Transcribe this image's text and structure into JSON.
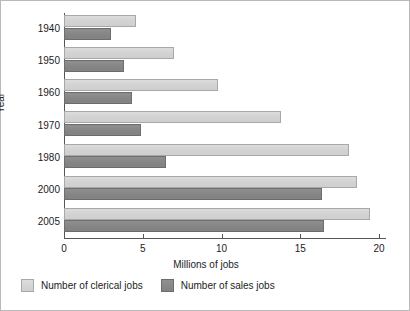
{
  "chart_data": {
    "type": "bar",
    "orientation": "horizontal",
    "title": "",
    "xlabel": "Millions of jobs",
    "ylabel": "Year",
    "categories": [
      "1940",
      "1950",
      "1960",
      "1970",
      "1980",
      "2000",
      "2005"
    ],
    "xlim": [
      0,
      20
    ],
    "xticks": [
      0,
      5,
      10,
      15,
      20
    ],
    "xtick_labels": [
      "0",
      "5",
      "10",
      "15",
      "20"
    ],
    "grid": false,
    "legend_position": "below-plot",
    "series": [
      {
        "name": "Number of clerical jobs",
        "color": "#d2d2d2",
        "values": [
          4.6,
          7.0,
          9.8,
          13.8,
          18.1,
          18.6,
          19.4
        ]
      },
      {
        "name": "Number of sales jobs",
        "color": "#858585",
        "values": [
          3.0,
          3.8,
          4.3,
          4.9,
          6.5,
          16.4,
          16.5
        ]
      }
    ]
  },
  "axes": {
    "y_title": "Year",
    "x_title": "Millions of jobs"
  },
  "legend": {
    "items": [
      {
        "label": "Number of clerical jobs",
        "swatch": "clerical"
      },
      {
        "label": "Number of sales jobs",
        "swatch": "sales"
      }
    ]
  }
}
